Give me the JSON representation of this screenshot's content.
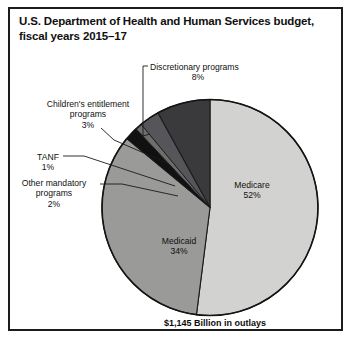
{
  "chart_data": {
    "type": "pie",
    "title": "U.S. Department of Health and Human Services budget, fiscal years 2015–17",
    "subtitle": "",
    "xlabel": "",
    "ylabel": "",
    "footnote": "$1,145 Billion in outlays",
    "legend_position": "none",
    "grid": false,
    "units": "percent of outlays",
    "total_outlays_label": "$1,145 Billion in outlays",
    "categories": [
      "Medicare",
      "Medicaid",
      "Other mandatory programs",
      "TANF",
      "Children's entitlement programs",
      "Discretionary programs"
    ],
    "values": [
      52,
      34,
      2,
      1,
      3,
      8
    ],
    "slices": [
      {
        "name": "Medicare",
        "value": 52,
        "value_label": "52%",
        "label_text": "Medicare",
        "color": "#d2d2d0",
        "label_placement": "inside"
      },
      {
        "name": "Medicaid",
        "value": 34,
        "value_label": "34%",
        "label_text": "Medicaid",
        "color": "#9a9a98",
        "label_placement": "inside"
      },
      {
        "name": "Other mandatory programs",
        "value": 2,
        "value_label": "2%",
        "label_text": "Other mandatory programs",
        "color": "#111111",
        "label_placement": "outside-left"
      },
      {
        "name": "TANF",
        "value": 1,
        "value_label": "1%",
        "label_text": "TANF",
        "color": "#6e6e6c",
        "label_placement": "outside-left"
      },
      {
        "name": "Children's entitlement programs",
        "value": 3,
        "value_label": "3%",
        "label_text": "Children's entitlement programs",
        "color": "#56565a",
        "label_placement": "outside-left"
      },
      {
        "name": "Discretionary programs",
        "value": 8,
        "value_label": "8%",
        "label_text": "Discretionary programs",
        "color": "#3a3a3c",
        "label_placement": "outside-top"
      }
    ]
  },
  "figure": {
    "title": "U.S. Department of Health and Human Services budget, fiscal years 2015–17",
    "footer": "$1,145 Billion in outlays"
  },
  "labels": {
    "discretionary": {
      "name": "Discretionary programs",
      "pct": "8%"
    },
    "children": {
      "name_line1": "Children's entitlement",
      "name_line2": "programs",
      "pct": "3%"
    },
    "tanf": {
      "name": "TANF",
      "pct": "1%"
    },
    "other_mandatory": {
      "name_line1": "Other mandatory",
      "name_line2": "programs",
      "pct": "2%"
    },
    "medicare": {
      "name": "Medicare",
      "pct": "52%"
    },
    "medicaid": {
      "name": "Medicaid",
      "pct": "34%"
    }
  },
  "colors": {
    "frame": "#1c1c1c",
    "background": "#ffffff",
    "text": "#111111",
    "medicare": "#d2d2d0",
    "medicaid": "#9a9a98",
    "other_mandatory": "#111111",
    "tanf": "#6e6e6c",
    "children": "#56565a",
    "discretionary": "#3a3a3c"
  }
}
